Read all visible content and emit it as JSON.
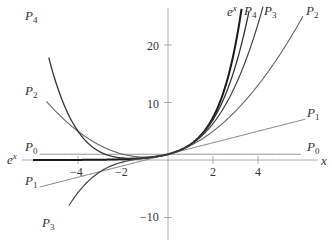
{
  "chart_data": {
    "type": "line",
    "title": "",
    "xlabel": "x",
    "ylabel": "",
    "xlim": [
      -6.0,
      6.3
    ],
    "ylim": [
      -12,
      27
    ],
    "grid": false,
    "x_ticks": [
      -4,
      -2,
      2,
      4
    ],
    "x_tick_labels": [
      "−4",
      "−2",
      "2",
      "4"
    ],
    "y_ticks": [
      -10,
      10,
      20
    ],
    "y_tick_labels": [
      "−10",
      "10",
      "20"
    ],
    "series": [
      {
        "name": "e^x",
        "label_base": "e",
        "label_sup": "x",
        "formula": "exp",
        "color": "#1a1a1a",
        "width": 2.0,
        "x_range": [
          -6.0,
          3.3
        ]
      },
      {
        "name": "P0",
        "label_base": "P",
        "label_sub": "0",
        "formula": [
          1
        ],
        "color": "#888888",
        "width": 1.0,
        "x_range": [
          -5.7,
          5.9
        ]
      },
      {
        "name": "P1",
        "label_base": "P",
        "label_sub": "1",
        "formula": [
          1,
          1
        ],
        "color": "#777777",
        "width": 1.0,
        "x_range": [
          -5.7,
          6.1
        ]
      },
      {
        "name": "P2",
        "label_base": "P",
        "label_sub": "2",
        "formula": [
          1,
          1,
          0.5
        ],
        "color": "#666666",
        "width": 1.1,
        "x_range": [
          -5.4,
          6.0
        ]
      },
      {
        "name": "P3",
        "label_base": "P",
        "label_sub": "3",
        "formula": [
          1,
          1,
          0.5,
          0.16666667
        ],
        "color": "#444444",
        "width": 1.2,
        "x_range": [
          -4.4,
          4.25
        ]
      },
      {
        "name": "P4",
        "label_base": "P",
        "label_sub": "4",
        "formula": [
          1,
          1,
          0.5,
          0.16666667,
          0.04166667
        ],
        "color": "#333333",
        "width": 1.3,
        "x_range": [
          -5.3,
          3.6
        ]
      }
    ],
    "annotations": [
      {
        "text": "P4",
        "position": "top-left"
      },
      {
        "text": "P2",
        "position": "left"
      },
      {
        "text": "P0",
        "position": "left"
      },
      {
        "text": "e^x",
        "position": "left"
      },
      {
        "text": "P1",
        "position": "left"
      },
      {
        "text": "P3",
        "position": "bottom-left"
      },
      {
        "text": "e^x",
        "position": "top"
      },
      {
        "text": "P4",
        "position": "top"
      },
      {
        "text": "P3",
        "position": "top"
      },
      {
        "text": "P2",
        "position": "top-right"
      },
      {
        "text": "P1",
        "position": "right"
      },
      {
        "text": "P0",
        "position": "right"
      }
    ]
  },
  "labels": {
    "x_axis": "x",
    "ex_base": "e",
    "ex_sup": "x",
    "p": "P",
    "sub0": "0",
    "sub1": "1",
    "sub2": "2",
    "sub3": "3",
    "sub4": "4",
    "tick_m4": "−4",
    "tick_m2": "−2",
    "tick_2": "2",
    "tick_4": "4",
    "tick_20": "20",
    "tick_10": "10",
    "tick_m10": "−10"
  }
}
